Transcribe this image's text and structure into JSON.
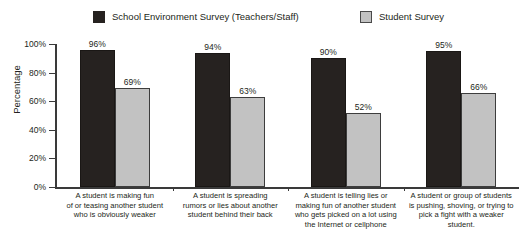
{
  "chart_data": {
    "type": "bar",
    "title": "",
    "xlabel": "",
    "ylabel": "Percentage",
    "ylim": [
      0,
      100
    ],
    "ytick_labels": [
      "0%",
      "20%",
      "40%",
      "60%",
      "80%",
      "100%"
    ],
    "ytick_values": [
      0,
      20,
      40,
      60,
      80,
      100
    ],
    "grid": false,
    "legend_position": "top",
    "categories": [
      "A student is making fun of or teasing another student who is obviously weaker",
      "A student is spreading rumors or lies about another student behind their back",
      "A student is telling lies or making fun of another student who gets picked on a lot using the Internet or cellphone",
      "A student or group of students is pushing, shoving, or trying to pick a fight with a weaker student."
    ],
    "category_lines": [
      [
        "A student is making fun",
        "of or teasing another student",
        "who is obviously weaker"
      ],
      [
        "A student is spreading",
        "rumors or lies about another",
        "student behind their back"
      ],
      [
        "A student is telling lies or",
        "making fun of another student",
        "who gets picked on a lot using",
        "the Internet or cellphone"
      ],
      [
        "A student or group of students",
        "is pushing, shoving, or trying to",
        "pick a fight with a weaker",
        "student."
      ]
    ],
    "series": [
      {
        "name": "School Environment Survey (Teachers/Staff)",
        "color": "#262220",
        "values": [
          96,
          94,
          90,
          95
        ],
        "value_labels": [
          "96%",
          "94%",
          "90%",
          "95%"
        ]
      },
      {
        "name": "Student Survey",
        "color": "#c2c2c2",
        "values": [
          69,
          63,
          52,
          66
        ],
        "value_labels": [
          "69%",
          "63%",
          "52%",
          "66%"
        ]
      }
    ]
  }
}
